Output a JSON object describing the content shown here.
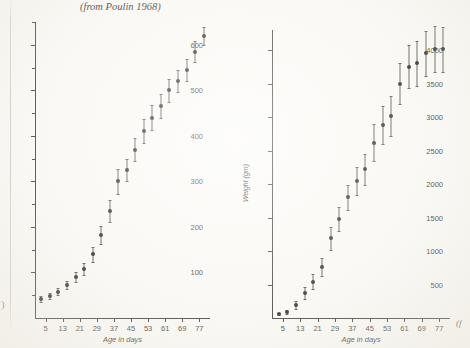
{
  "figure": {
    "caption_line1": "(d)  Growth of young gannets Morus bassanus, Bonaventure Island",
    "caption_line2": "(from Poulin 1968)",
    "figure_mark": "(f",
    "page_paren": ")"
  },
  "chart_data": [
    {
      "type": "scatter",
      "id": "left-chart",
      "title": "",
      "xlabel": "Age in days",
      "ylabel": "",
      "xlim": [
        0,
        82
      ],
      "ylim": [
        0,
        650
      ],
      "xticks": [
        5,
        13,
        21,
        29,
        37,
        45,
        53,
        61,
        69,
        77
      ],
      "yticks": [
        100,
        200,
        300,
        400,
        500,
        600
      ],
      "yticks_minor": [
        50,
        150,
        250,
        350,
        450,
        550,
        650
      ],
      "grid": false,
      "legend": null,
      "error_bars": "vertical",
      "x": [
        3,
        7,
        11,
        15,
        19,
        23,
        27,
        31,
        35,
        39,
        43,
        47,
        51,
        55,
        59,
        63,
        67,
        71,
        75,
        79
      ],
      "values": [
        42,
        48,
        58,
        72,
        90,
        108,
        140,
        182,
        235,
        300,
        325,
        370,
        410,
        440,
        465,
        500,
        520,
        545,
        585,
        620
      ],
      "yerr": [
        6,
        6,
        7,
        9,
        11,
        13,
        16,
        19,
        24,
        27,
        24,
        26,
        26,
        27,
        26,
        25,
        24,
        24,
        23,
        20
      ]
    },
    {
      "type": "scatter",
      "id": "right-chart",
      "title": "",
      "xlabel": "Age in days",
      "ylabel": "Weight (gm)",
      "xlim": [
        0,
        82
      ],
      "ylim": [
        0,
        4300
      ],
      "xticks": [
        5,
        13,
        21,
        29,
        37,
        45,
        53,
        61,
        69,
        77
      ],
      "yticks": [
        500,
        1000,
        1500,
        2000,
        2500,
        3000,
        3500,
        4000
      ],
      "grid": false,
      "legend": null,
      "error_bars": "vertical",
      "x": [
        3,
        7,
        11,
        15,
        19,
        23,
        27,
        31,
        35,
        39,
        43,
        47,
        51,
        55,
        59,
        63,
        67,
        71,
        75,
        79
      ],
      "values": [
        60,
        95,
        200,
        380,
        540,
        760,
        1190,
        1480,
        1800,
        2040,
        2220,
        2620,
        2880,
        3020,
        3500,
        3750,
        3800,
        3950,
        4020,
        4010
      ],
      "yerr": [
        20,
        30,
        60,
        90,
        110,
        130,
        170,
        180,
        190,
        210,
        230,
        270,
        280,
        300,
        310,
        320,
        330,
        330,
        340,
        330
      ]
    }
  ]
}
